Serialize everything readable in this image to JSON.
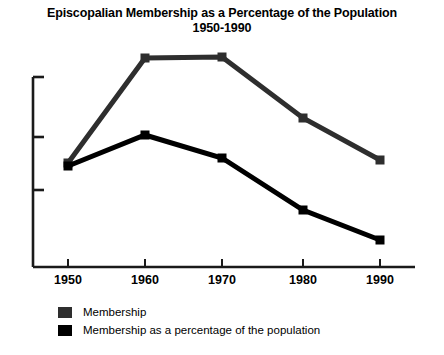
{
  "chart_data": {
    "type": "line",
    "title": "Episcopalian Membership as a Percentage of the Population",
    "subtitle": "1950-1990",
    "xlabel": "",
    "ylabel": "",
    "grid": false,
    "legend_position": "bottom-left",
    "x": [
      "1950",
      "1960",
      "1970",
      "1980",
      "1990"
    ],
    "categories": [
      "1950",
      "1960",
      "1970",
      "1980",
      "1990"
    ],
    "xtick_labels": [
      "1950",
      "1960",
      "1970",
      "1980",
      "1990"
    ],
    "ytick_labels": [],
    "y_axis_has_labels": false,
    "y_tick_count": 4,
    "series": [
      {
        "name": "Membership",
        "color": "#2e2e2e",
        "values": [
          55,
          100,
          100.5,
          78,
          68
        ],
        "points_px": [
          {
            "x": 68,
            "y": 163
          },
          {
            "x": 145,
            "y": 58
          },
          {
            "x": 222,
            "y": 57
          },
          {
            "x": 303,
            "y": 118
          },
          {
            "x": 380,
            "y": 160
          }
        ]
      },
      {
        "name": "Membership as a percentage of the population",
        "color": "#000000",
        "values": [
          53.5,
          68,
          58,
          35,
          21
        ],
        "points_px": [
          {
            "x": 68,
            "y": 166
          },
          {
            "x": 145,
            "y": 135
          },
          {
            "x": 222,
            "y": 158
          },
          {
            "x": 303,
            "y": 210
          },
          {
            "x": 380,
            "y": 240
          }
        ]
      }
    ],
    "axis": {
      "x_axis_y_px": 267,
      "y_axis_x_px": 33,
      "y_axis_top_px": 77,
      "x_axis_right_px": 415,
      "y_tick_positions_px": [
        77,
        137,
        190,
        267
      ],
      "x_tick_positions_px": [
        68,
        145,
        222,
        303,
        380
      ]
    }
  },
  "legend": {
    "items": [
      {
        "label": "Membership",
        "color": "#2e2e2e"
      },
      {
        "label": "Membership as a percentage of the population",
        "color": "#000000"
      }
    ]
  }
}
